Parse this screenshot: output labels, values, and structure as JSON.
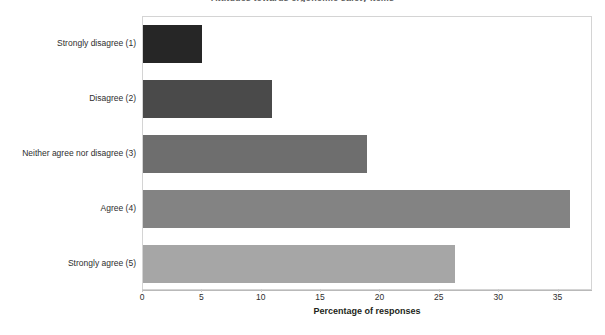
{
  "chart_data": {
    "type": "bar",
    "orientation": "horizontal",
    "title": "Attitudes towards ergonomic safety items",
    "categories": [
      "Strongly disagree (1)",
      "Disagree (2)",
      "Neither agree nor disagree (3)",
      "Agree (4)",
      "Strongly agree (5)"
    ],
    "values": [
      5.0,
      10.9,
      18.9,
      36.0,
      26.3
    ],
    "xlabel": "Percentage of responses",
    "ylabel": "",
    "xlim": [
      0,
      37.9
    ],
    "ylim": null,
    "xticks": [
      0,
      5,
      10,
      15,
      20,
      25,
      30,
      35
    ],
    "xtick_labels": [
      "0",
      "5",
      "10",
      "15",
      "20",
      "25",
      "30",
      "35"
    ],
    "grid": false,
    "legend": false,
    "bar_colors": [
      "#262626",
      "#4a4a4a",
      "#6e6e6e",
      "#838383",
      "#a6a6a6"
    ],
    "plot_border_color": "#d4d4d4",
    "axis_color": "#b9b9b9"
  }
}
